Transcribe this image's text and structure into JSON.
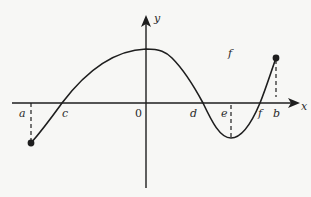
{
  "diagram": {
    "type": "function-graph",
    "axes": {
      "x_label": "x",
      "y_label": "y",
      "origin_label": "0"
    },
    "function_label": "f",
    "x_points": [
      {
        "id": "a",
        "label": "a",
        "note": "left endpoint; dashed line down to f(a) < 0"
      },
      {
        "id": "c",
        "label": "c",
        "note": "zero of f"
      },
      {
        "id": "origin",
        "label": "0",
        "note": "origin"
      },
      {
        "id": "d",
        "label": "d",
        "note": "zero of f"
      },
      {
        "id": "e",
        "label": "e",
        "note": "local minimum; dashed line down to f(e)"
      },
      {
        "id": "f",
        "label": "f",
        "note": "zero of f"
      },
      {
        "id": "b",
        "label": "b",
        "note": "right endpoint; dashed line up to f(b) > 0"
      }
    ],
    "features": {
      "endpoints_closed": true,
      "local_max_near": "0",
      "local_min_at": "e"
    }
  },
  "colors": {
    "background": "#f7f7f5",
    "ink": "#1e1e1e"
  }
}
